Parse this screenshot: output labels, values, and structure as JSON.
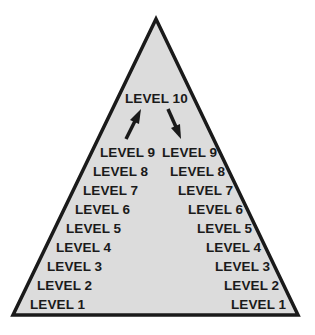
{
  "diagram": {
    "type": "pyramid",
    "colors": {
      "fill": "#dcdcdc",
      "stroke": "#1a1a1a",
      "text": "#1a1a1a"
    },
    "top_label": "LEVEL 10",
    "arrows": [
      {
        "name": "up-arrow",
        "direction": "up",
        "side": "left"
      },
      {
        "name": "down-arrow",
        "direction": "down",
        "side": "right"
      }
    ],
    "left_column": [
      "LEVEL 9",
      "LEVEL 8",
      "LEVEL 7",
      "LEVEL 6",
      "LEVEL 5",
      "LEVEL 4",
      "LEVEL 3",
      "LEVEL 2",
      "LEVEL 1"
    ],
    "right_column": [
      "LEVEL 9",
      "LEVEL 8",
      "LEVEL 7",
      "LEVEL 6",
      "LEVEL 5",
      "LEVEL 4",
      "LEVEL 3",
      "LEVEL 2",
      "LEVEL 1"
    ],
    "stray_mark": "s"
  }
}
